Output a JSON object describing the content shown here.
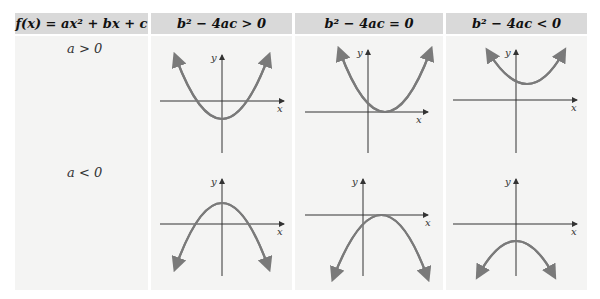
{
  "header": {
    "col1": "f(x) = ax² + bx + c",
    "col2": "b² − 4ac > 0",
    "col3": "b² − 4ac = 0",
    "col4": "b² − 4ac < 0"
  },
  "rows": [
    {
      "label": "a > 0"
    },
    {
      "label": "a < 0"
    }
  ],
  "axis_labels": {
    "x": "x",
    "y": "y"
  },
  "colors": {
    "header_bg": "#d9d9d9",
    "cell_bg": "#f4f4f3",
    "curve": "#7a7a7a",
    "axis": "#333333"
  },
  "graphs": [
    {
      "row": "a > 0",
      "case": "b² − 4ac > 0",
      "opens": "up",
      "x_intercepts": 2
    },
    {
      "row": "a > 0",
      "case": "b² − 4ac = 0",
      "opens": "up",
      "x_intercepts": 1
    },
    {
      "row": "a > 0",
      "case": "b² − 4ac < 0",
      "opens": "up",
      "x_intercepts": 0
    },
    {
      "row": "a < 0",
      "case": "b² − 4ac > 0",
      "opens": "down",
      "x_intercepts": 2
    },
    {
      "row": "a < 0",
      "case": "b² − 4ac = 0",
      "opens": "down",
      "x_intercepts": 1
    },
    {
      "row": "a < 0",
      "case": "b² − 4ac < 0",
      "opens": "down",
      "x_intercepts": 0
    }
  ]
}
